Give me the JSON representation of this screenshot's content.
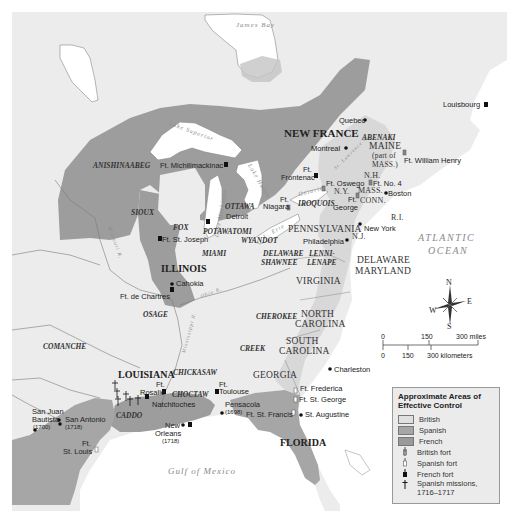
{
  "colors": {
    "land": "#ededed",
    "water": "#ffffff",
    "british": "#d9d9d9",
    "spanish": "#a6a6a6",
    "french": "#9d9d9d",
    "border": "#6e6e6e"
  },
  "water_labels": {
    "james_bay": "James Bay",
    "lake_superior": "Lake Superior",
    "lake_michigan": "Lake Michigan",
    "lake_huron": "Lake Huron",
    "lake_ontario": "Ontario",
    "lake_erie": "L. Erie",
    "st_lawrence": "St. Lawrence R.",
    "missouri": "Missouri R.",
    "mississippi": "Mississippi R.",
    "ohio": "Ohio R.",
    "atlantic_1": "ATLANTIC",
    "atlantic_2": "OCEAN",
    "gulf": "Gulf of Mexico"
  },
  "regions": {
    "new_france": "NEW FRANCE",
    "illinois": "ILLINOIS",
    "louisiana": "LOUISIANA",
    "florida": "FLORIDA",
    "maine_1": "MAINE",
    "maine_2": "(part of",
    "maine_3": "MASS.)",
    "nh": "N.H.",
    "ny": "N.Y.",
    "mass": "MASS.",
    "conn": "CONN.",
    "ri": "R.I.",
    "nj": "N.J.",
    "pennsylvania": "PENNSYLVANIA",
    "delaware": "DELAWARE",
    "maryland": "MARYLAND",
    "virginia": "VIRGINIA",
    "north_carolina_1": "NORTH",
    "north_carolina_2": "CAROLINA",
    "south_carolina_1": "SOUTH",
    "south_carolina_2": "CAROLINA",
    "georgia": "GEORGIA"
  },
  "tribes": {
    "abenaki": "ABENAKI",
    "anishinaabeg": "ANISHINAABEG",
    "ottawa": "OTTAWA",
    "iroquois": "IROQUOIS",
    "sioux": "SIOUX",
    "fox": "FOX",
    "potawatomi": "POTAWATOMI",
    "wyandot": "WYANDOT",
    "miami": "MIAMI",
    "delaware_shawnee_1": "DELAWARE",
    "delaware_shawnee_2": "SHAWNEE",
    "lenni_lenape_1": "LENNI-",
    "lenni_lenape_2": "LENAPE",
    "osage": "OSAGE",
    "cherokee": "CHEROKEE",
    "creek": "CREEK",
    "comanche": "COMANCHE",
    "chickasaw": "CHICKASAW",
    "choctaw": "CHOCTAW",
    "caddo": "CADDO"
  },
  "places": {
    "quebec": "Quebec",
    "montreal": "Montreal",
    "louisbourg": "Louisbourg",
    "ft_william_henry": "Ft. William Henry",
    "ft_frontenac_1": "Ft.",
    "ft_frontenac_2": "Frontenac",
    "ft_oswego": "Ft. Oswego",
    "ft_no4": "Ft. No. 4",
    "boston": "Boston",
    "ft_george_1": "Ft.",
    "ft_george_2": "George",
    "ft_niagara_1": "Ft.",
    "ft_niagara_2": "Niagara",
    "ft_michilimackinac": "Ft. Michilimackinac",
    "detroit": "Detroit",
    "ft_st_joseph": "Ft. St. Joseph",
    "new_york": "New York",
    "philadelphia": "Philadelphia",
    "cahokia": "Cahokia",
    "ft_de_chartres": "Ft. de Chartres",
    "charleston": "Charleston",
    "ft_frederica": "Ft. Frederica",
    "ft_st_george": "Ft. St. George",
    "st_augustine": "St. Augustine",
    "ft_st_francis": "Ft. St. Francis",
    "pensacola": "Pensacola",
    "pensacola_year": "(1698)",
    "ft_toulouse_1": "Ft.",
    "ft_toulouse_2": "Toulouse",
    "ft_rosalie_1": "Ft.",
    "ft_rosalie_2": "Rosalie",
    "natchitoches": "Natchitoches",
    "new_orleans_1": "New",
    "new_orleans_2": "Orleans",
    "new_orleans_year": "(1718)",
    "san_juan_1": "San Juan",
    "san_juan_2": "Bautista",
    "san_juan_year": "(1700)",
    "san_antonio": "San Antonio",
    "san_antonio_year": "(1718)",
    "ft_st_louis_1": "Ft.",
    "ft_st_louis_2": "St. Louis"
  },
  "compass": {
    "n": "N",
    "s": "S",
    "e": "E",
    "w": "W"
  },
  "scale": {
    "miles": [
      "0",
      "150",
      "300 miles"
    ],
    "km": [
      "0",
      "150",
      "300 kilometers"
    ]
  },
  "legend": {
    "title": "Approximate Areas of Effective Control",
    "items": [
      {
        "label": "British",
        "type": "swatch",
        "color": "#d9d9d9"
      },
      {
        "label": "Spanish",
        "type": "swatch",
        "color": "#a6a6a6"
      },
      {
        "label": "French",
        "type": "swatch",
        "color": "#9d9d9d"
      },
      {
        "label": "British fort",
        "type": "icon",
        "icon": "british-fort-icon"
      },
      {
        "label": "Spanish fort",
        "type": "icon",
        "icon": "spanish-fort-icon"
      },
      {
        "label": "French fort",
        "type": "icon",
        "icon": "french-fort-icon"
      },
      {
        "label": "Spanish missions, 1716–1717",
        "type": "icon",
        "icon": "mission-cross-icon"
      }
    ]
  }
}
